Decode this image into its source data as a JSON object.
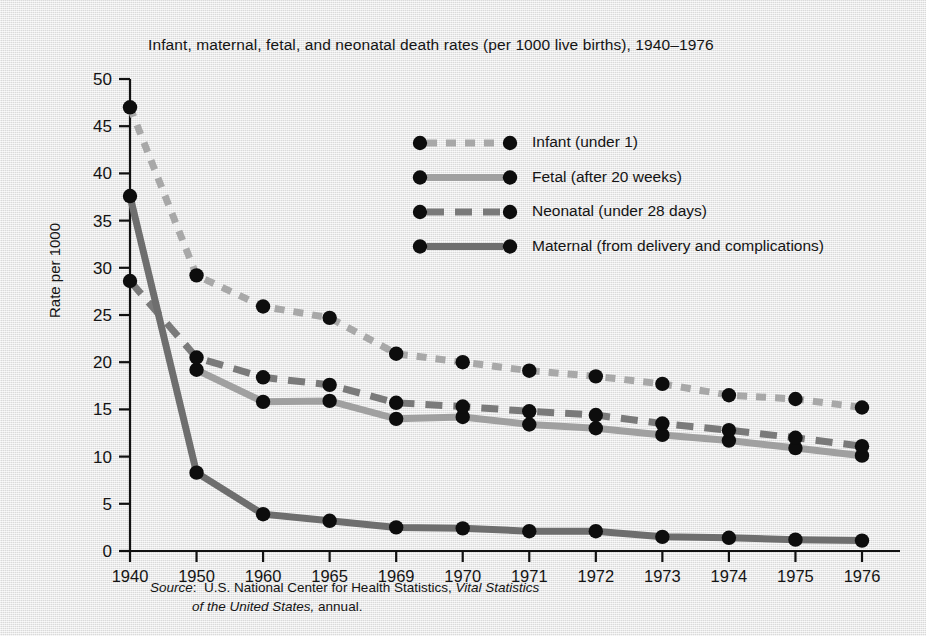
{
  "title": "Infant, maternal, fetal, and neonatal death rates (per 1000 live births), 1940–1976",
  "axes": {
    "ylabel": "Rate per 1000",
    "yticks": [
      "0",
      "5",
      "10",
      "15",
      "20",
      "25",
      "30",
      "35",
      "40",
      "45",
      "50"
    ],
    "xticks": [
      "1940",
      "1950",
      "1960",
      "1965",
      "1969",
      "1970",
      "1971",
      "1972",
      "1973",
      "1974",
      "1975",
      "1976"
    ]
  },
  "legend": {
    "items": [
      {
        "label": "Infant (under 1)",
        "style": "dotted",
        "color": "#a8a8a8"
      },
      {
        "label": "Fetal (after 20 weeks)",
        "style": "solid",
        "color": "#a0a0a0"
      },
      {
        "label": "Neonatal (under 28 days)",
        "style": "dashed",
        "color": "#7a7a7a"
      },
      {
        "label": "Maternal (from delivery and complications)",
        "style": "solid",
        "color": "#6e6e6e"
      }
    ]
  },
  "source": {
    "lead": "Source",
    "colon": ":",
    "body_1": "U.S. National Center for Health Statistics,",
    "italic_1": "Vital Statistics",
    "italic_2": "of the United States,",
    "body_2": "annual."
  },
  "chart_data": {
    "type": "line",
    "title": "Infant, maternal, fetal, and neonatal death rates (per 1000 live births), 1940–1976",
    "xlabel": "",
    "ylabel": "Rate per 1000",
    "categories": [
      "1940",
      "1950",
      "1960",
      "1965",
      "1969",
      "1970",
      "1971",
      "1972",
      "1973",
      "1974",
      "1975",
      "1976"
    ],
    "ylim": [
      0,
      50
    ],
    "ytick_step": 5,
    "grid": false,
    "legend_position": "upper-right-inside",
    "series": [
      {
        "name": "Infant (under 1)",
        "color": "#a8a8a8",
        "linestyle": "dotted",
        "values": [
          47.0,
          29.2,
          25.9,
          24.7,
          20.9,
          20.0,
          19.1,
          18.5,
          17.7,
          16.5,
          16.1,
          15.2
        ]
      },
      {
        "name": "Fetal (after 20 weeks)",
        "color": "#a0a0a0",
        "linestyle": "solid",
        "values": [
          null,
          19.2,
          15.8,
          15.9,
          14.0,
          14.2,
          13.4,
          13.0,
          12.3,
          11.7,
          10.9,
          10.1
        ]
      },
      {
        "name": "Neonatal (under 28 days)",
        "color": "#7a7a7a",
        "linestyle": "dashed",
        "values": [
          28.6,
          20.5,
          18.4,
          17.6,
          15.7,
          15.3,
          14.8,
          14.4,
          13.5,
          12.8,
          12.0,
          11.1
        ]
      },
      {
        "name": "Maternal (from delivery and complications)",
        "color": "#6e6e6e",
        "linestyle": "solid",
        "values": [
          37.6,
          8.3,
          3.9,
          3.2,
          2.5,
          2.4,
          2.1,
          2.1,
          1.5,
          1.4,
          1.2,
          1.1
        ]
      }
    ]
  }
}
